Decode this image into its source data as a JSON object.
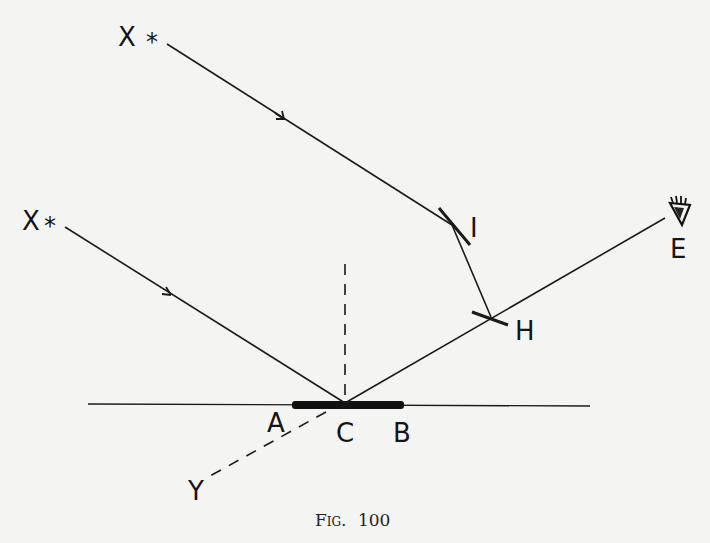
{
  "figure": {
    "caption_prefix": "Fig.",
    "caption_number": "100",
    "caption": "Fig. 100",
    "labels": {
      "star_upper": "X",
      "star_lower": "X",
      "star_symbol": "*",
      "mirror_I": "I",
      "mirror_H": "H",
      "eye": "E",
      "point_A": "A",
      "point_C": "C",
      "point_B": "B",
      "point_Y": "Y"
    },
    "icons": {
      "eye": "eye-icon",
      "star": "asterisk-star-icon"
    },
    "colors": {
      "background": "#f4f4f2",
      "ink": "#1a1a1a"
    }
  }
}
